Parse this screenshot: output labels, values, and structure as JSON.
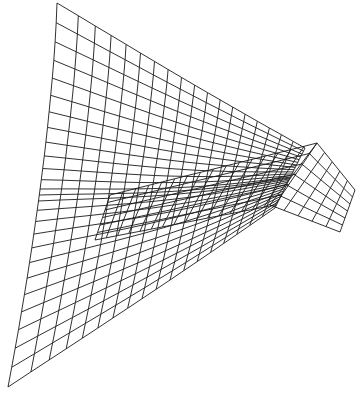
{
  "figure": {
    "type": "wireframe-surface",
    "background": "#ffffff",
    "line_color": "#1a1a1a",
    "grid": {
      "u_lines": 22,
      "v_lines": 24
    },
    "outline": {
      "top_left": [
        57,
        3
      ],
      "top_right": [
        300,
        150
      ],
      "ridge_peak": [
        317,
        143
      ],
      "right_tip": [
        355,
        190
      ],
      "right_bottom": [
        340,
        232
      ],
      "bottom_left": [
        8,
        387
      ],
      "bottom_right": [
        270,
        210
      ]
    }
  }
}
